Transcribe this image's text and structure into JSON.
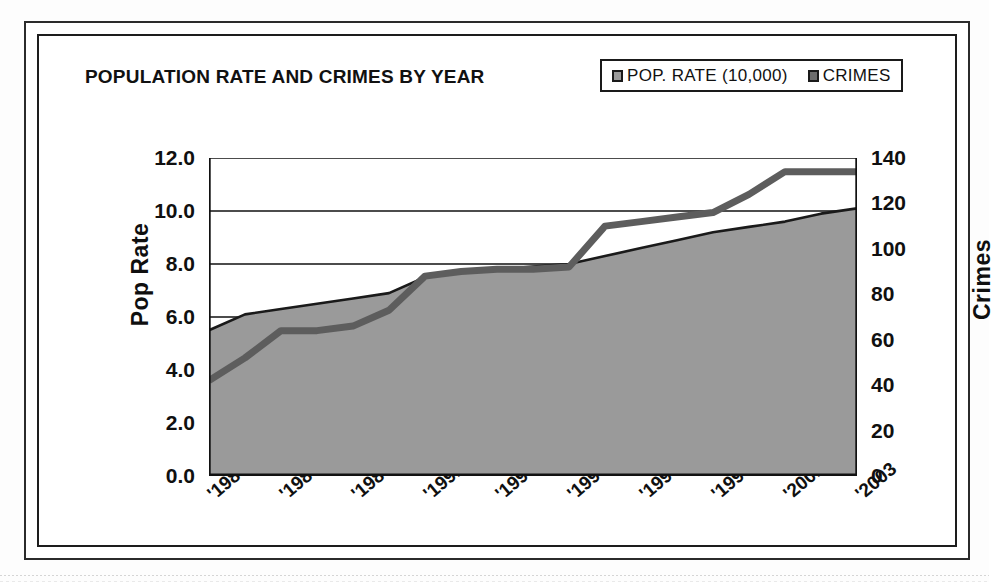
{
  "chart_data": {
    "type": "area",
    "title": "POPULATION RATE AND CRIMES BY YEAR",
    "xlabel": "",
    "ylabel": "Pop Rate",
    "y2label": "Crimes",
    "grid": true,
    "legend_position": "top-right",
    "ylim": [
      0.0,
      12.0
    ],
    "y2lim": [
      0,
      140
    ],
    "x": [
      1985,
      1986,
      1987,
      1988,
      1989,
      1990,
      1991,
      1992,
      1993,
      1994,
      1995,
      1996,
      1997,
      1998,
      1999,
      2000,
      2001,
      2002,
      2003
    ],
    "categories": [
      "'1985",
      "'1986",
      "'1987",
      "'1988",
      "'1989",
      "'1990",
      "'1991",
      "'1992",
      "'1993",
      "'1994",
      "'1995",
      "'1996",
      "'1997",
      "'1998",
      "'1999",
      "'2000",
      "'2001",
      "'2002",
      "'2003"
    ],
    "xtick_labels": [
      "'1985",
      "'1987",
      "'1989",
      "'1991",
      "'1993",
      "'1995",
      "'1997",
      "'1999",
      "'2001",
      "'2003"
    ],
    "xtick_years": [
      1985,
      1987,
      1989,
      1991,
      1993,
      1995,
      1997,
      1999,
      2001,
      2003
    ],
    "ytick_labels": [
      "0.0",
      "2.0",
      "4.0",
      "6.0",
      "8.0",
      "10.0",
      "12.0"
    ],
    "ytick_values": [
      0.0,
      2.0,
      4.0,
      6.0,
      8.0,
      10.0,
      12.0
    ],
    "y2tick_labels": [
      "0",
      "20",
      "40",
      "60",
      "80",
      "100",
      "120",
      "140"
    ],
    "y2tick_values": [
      0,
      20,
      40,
      60,
      80,
      100,
      120,
      140
    ],
    "series": [
      {
        "name": "POP. RATE (10,000)",
        "axis": "left",
        "render": "area",
        "color": "#9a9a9a",
        "line_color": "#1a1a1a",
        "values": [
          5.5,
          6.1,
          6.3,
          6.5,
          6.7,
          6.9,
          7.5,
          7.7,
          7.8,
          7.9,
          8.0,
          8.3,
          8.6,
          8.9,
          9.2,
          9.4,
          9.6,
          9.9,
          10.1
        ]
      },
      {
        "name": "CRIMES",
        "axis": "right",
        "render": "line",
        "color": "#5d5d5d",
        "values": [
          42,
          52,
          64,
          64,
          66,
          73,
          88,
          90,
          91,
          91,
          92,
          110,
          112,
          114,
          116,
          124,
          134,
          134,
          134
        ]
      }
    ]
  },
  "legend": {
    "entries": [
      {
        "label": "POP. RATE (10,000)",
        "swatch_class": "poprate"
      },
      {
        "label": "CRIMES",
        "swatch_class": "crimes"
      }
    ]
  }
}
